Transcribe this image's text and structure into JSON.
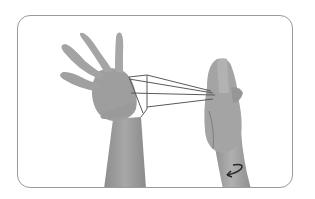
{
  "figure": {
    "colors": {
      "background": "#ffffff",
      "frame_border": "#9a9a9a",
      "skin": "#9c9c9c",
      "skin_shadow": "#7a7a7a",
      "string": "#5a5a5a",
      "arrow": "#2a2a2a"
    },
    "icons": {
      "rotation_arrow": "curved-arrow-icon"
    }
  }
}
